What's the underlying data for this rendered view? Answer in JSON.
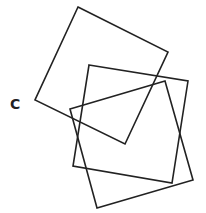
{
  "figure": {
    "label": "C",
    "stroke_color": "#222222",
    "stroke_width": 1.6,
    "squares": [
      {
        "name": "square-1",
        "points": "78,7 168,52 125,144 35,100"
      },
      {
        "name": "square-2",
        "points": "89,65 188,81 172,183 73,166"
      },
      {
        "name": "square-3",
        "points": "70,109 165,81 193,180 97,208"
      }
    ]
  }
}
